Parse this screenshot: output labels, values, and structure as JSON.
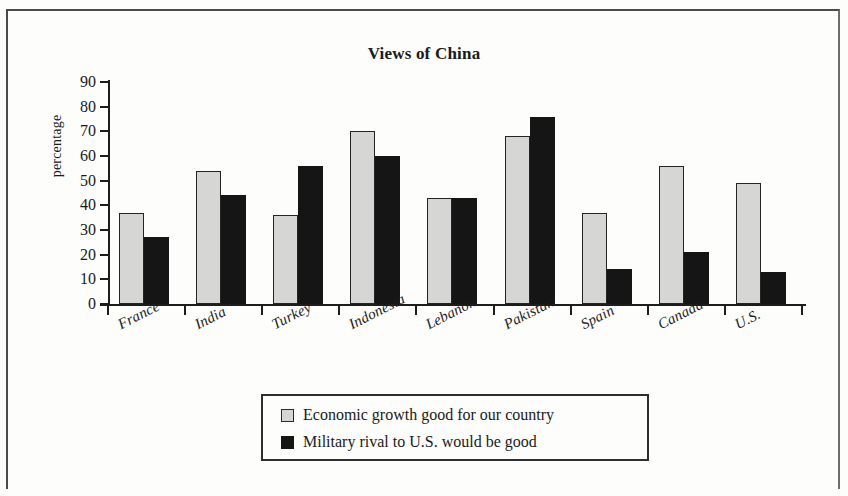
{
  "chart_data": {
    "type": "bar",
    "title": "Views of China",
    "xlabel": "",
    "ylabel": "percentage",
    "ylim": [
      0,
      90
    ],
    "yticks": [
      0,
      10,
      20,
      30,
      40,
      50,
      60,
      70,
      80,
      90
    ],
    "grid": false,
    "legend_position": "bottom",
    "categories": [
      "France",
      "India",
      "Turkey",
      "Indonesia",
      "Lebanon",
      "Pakistan",
      "Spain",
      "Canada",
      "U.S."
    ],
    "series": [
      {
        "name": "Economic growth good for our country",
        "color": "#d6d6d4",
        "values": [
          37,
          54,
          36,
          70,
          43,
          68,
          37,
          56,
          49
        ]
      },
      {
        "name": "Military rival to U.S. would be good",
        "color": "#151515",
        "values": [
          27,
          44,
          56,
          60,
          43,
          76,
          14,
          21,
          13
        ]
      }
    ]
  }
}
